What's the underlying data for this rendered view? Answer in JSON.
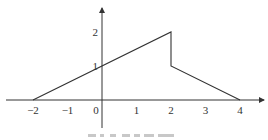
{
  "chart_data": {
    "type": "line",
    "title": "",
    "xlabel": "",
    "ylabel": "",
    "x_ticks": [
      "−2",
      "−1",
      "0",
      "1",
      "2",
      "3",
      "4"
    ],
    "x_tick_values": [
      -2,
      -1,
      0,
      1,
      2,
      3,
      4
    ],
    "y_ticks": [
      "1",
      "2"
    ],
    "y_tick_values": [
      1,
      2
    ],
    "xlim": [
      -2.8,
      5.0
    ],
    "ylim": [
      -0.8,
      2.6
    ],
    "grid": false,
    "legend": null,
    "series": [
      {
        "name": "f(x)",
        "points": [
          [
            -2,
            0
          ],
          [
            2,
            2
          ],
          [
            2,
            1
          ],
          [
            4,
            0
          ]
        ],
        "color": "#333333"
      }
    ],
    "annotations": [],
    "caption_legible": false
  },
  "colors": {
    "axis": "#333333",
    "line": "#333333",
    "caption": "#c8c8c8"
  }
}
